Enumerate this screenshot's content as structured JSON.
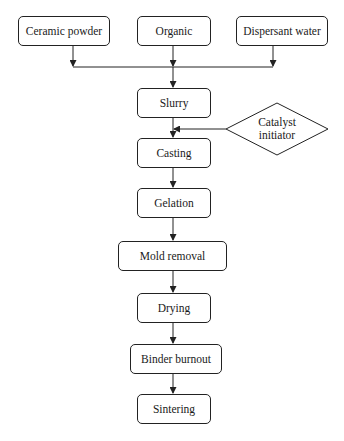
{
  "diagram": {
    "type": "flowchart",
    "inputs": [
      {
        "id": "ceramic_powder",
        "label": "Ceramic powder"
      },
      {
        "id": "organic",
        "label": "Organic"
      },
      {
        "id": "dispersant_water",
        "label": "Dispersant water"
      }
    ],
    "steps": [
      {
        "id": "slurry",
        "label": "Slurry"
      },
      {
        "id": "casting",
        "label": "Casting"
      },
      {
        "id": "gelation",
        "label": "Gelation"
      },
      {
        "id": "mold_removal",
        "label": "Mold removal"
      },
      {
        "id": "drying",
        "label": "Drying"
      },
      {
        "id": "binder_burnout",
        "label": "Binder burnout"
      },
      {
        "id": "sintering",
        "label": "Sintering"
      }
    ],
    "side_input": {
      "id": "catalyst_initiator",
      "shape": "diamond",
      "line1": "Catalyst",
      "line2": "initiator",
      "joins_between": [
        "slurry",
        "casting"
      ]
    },
    "edges": [
      [
        "ceramic_powder",
        "slurry"
      ],
      [
        "organic",
        "slurry"
      ],
      [
        "dispersant_water",
        "slurry"
      ],
      [
        "slurry",
        "casting"
      ],
      [
        "catalyst_initiator",
        "casting"
      ],
      [
        "casting",
        "gelation"
      ],
      [
        "gelation",
        "mold_removal"
      ],
      [
        "mold_removal",
        "drying"
      ],
      [
        "drying",
        "binder_burnout"
      ],
      [
        "binder_burnout",
        "sintering"
      ]
    ]
  }
}
